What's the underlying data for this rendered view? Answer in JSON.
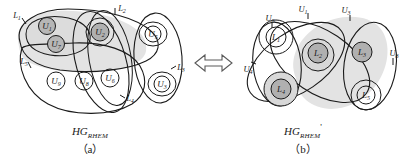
{
  "figure": {
    "type": "hypergraph-transformation-diagram",
    "relation_symbol": "⟺",
    "panels": [
      {
        "id": "a",
        "panel_label": "（a）",
        "graph_name": "HG",
        "graph_subscript": "RHEM",
        "graph_prime": "",
        "nodes": [
          {
            "label": "U",
            "sub": "1",
            "shaded": true
          },
          {
            "label": "U",
            "sub": "7",
            "shaded": true
          },
          {
            "label": "U",
            "sub": "2",
            "shaded": true
          },
          {
            "label": "U",
            "sub": "5",
            "shaded": false
          },
          {
            "label": "U",
            "sub": "3",
            "shaded": false
          },
          {
            "label": "U",
            "sub": "6",
            "shaded": false
          },
          {
            "label": "U",
            "sub": "9",
            "shaded": false
          },
          {
            "label": "U",
            "sub": "8",
            "shaded": false
          }
        ],
        "edge_labels": [
          {
            "label": "L",
            "sub": "1"
          },
          {
            "label": "L",
            "sub": "2"
          },
          {
            "label": "L",
            "sub": "3"
          },
          {
            "label": "L",
            "sub": "4"
          },
          {
            "label": "L",
            "sub": "5"
          }
        ]
      },
      {
        "id": "b",
        "panel_label": "（b）",
        "graph_name": "HG",
        "graph_subscript": "RHEM",
        "graph_prime": "'",
        "nodes": [
          {
            "label": "L",
            "sub": "1",
            "shaded": false
          },
          {
            "label": "L",
            "sub": "2",
            "shaded": true
          },
          {
            "label": "L",
            "sub": "3",
            "shaded": true
          },
          {
            "label": "L",
            "sub": "4",
            "shaded": true
          },
          {
            "label": "L",
            "sub": "5",
            "shaded": false
          }
        ],
        "edge_labels": [
          {
            "label": "U",
            "sub": "1"
          },
          {
            "label": "U",
            "sub": "3"
          },
          {
            "label": "U",
            "sub": "4"
          },
          {
            "label": "U",
            "sub": "6"
          },
          {
            "label": "U",
            "sub": "8"
          }
        ]
      }
    ],
    "colors": {
      "ink": "#1a1a1a",
      "shade_fill": "#e2e2e2",
      "node_fill": "#b9b9b9",
      "page": "#ffffff"
    }
  }
}
